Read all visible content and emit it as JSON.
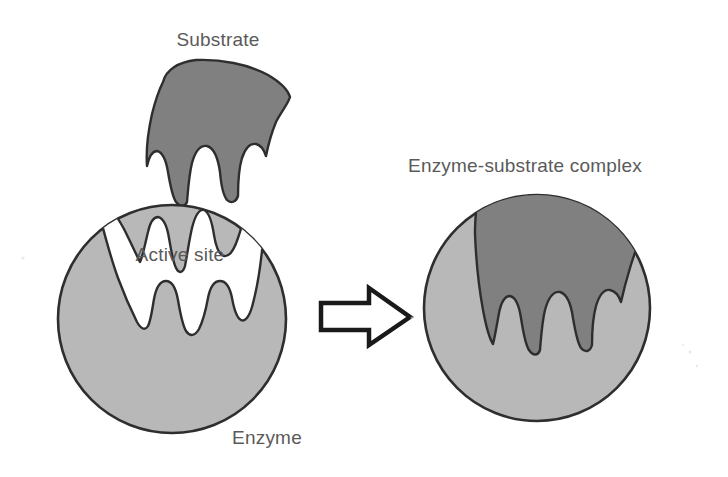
{
  "diagram": {
    "background_color": "#ffffff",
    "labels": {
      "substrate": "Substrate",
      "active_site": "Active site",
      "enzyme": "Enzyme",
      "complex": "Enzyme-substrate complex"
    },
    "colors": {
      "substrate_fill": "#808080",
      "enzyme_fill": "#b8b8b8",
      "outline": "#2e2e2e",
      "label_text": "#5a5a5a",
      "arrow_fill": "#ffffff",
      "arrow_stroke": "#1a1a1a",
      "cavity_fill": "#ffffff"
    },
    "shapes": {
      "substrate": {
        "name": "substrate-blob",
        "description": "dark gray irregular blob with three rounded downward prongs",
        "bounds": {
          "x": 145,
          "y": 60,
          "width": 145,
          "height": 143
        }
      },
      "enzyme": {
        "name": "enzyme-circle",
        "description": "light gray circle with a notched white active site cavity on top",
        "center_x": 172,
        "center_y": 319,
        "radius": 114
      },
      "arrow": {
        "name": "transformation-arrow",
        "direction": "right",
        "bounds": {
          "x": 320,
          "y": 288,
          "width": 90,
          "height": 57
        }
      },
      "complex": {
        "name": "enzyme-substrate-complex-circle",
        "description": "light gray circle with the dark gray substrate seated in the active site",
        "center_x": 537,
        "center_y": 308,
        "radius": 113
      }
    },
    "label_positions": {
      "substrate": {
        "x": 218,
        "y": 46
      },
      "active_site": {
        "x": 180,
        "y": 261
      },
      "enzyme": {
        "x": 267,
        "y": 444
      },
      "complex": {
        "x": 525,
        "y": 172
      }
    }
  }
}
